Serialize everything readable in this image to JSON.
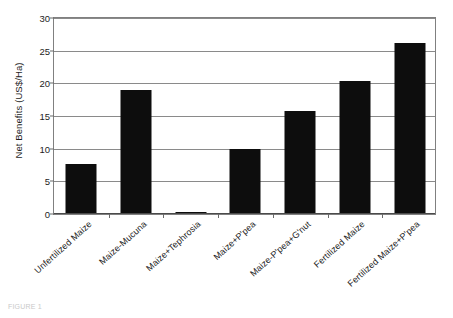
{
  "chart_data": {
    "type": "bar",
    "title": "",
    "xlabel": "",
    "ylabel": "Net Benefits (US$/Ha)",
    "ylim": [
      0,
      30
    ],
    "ytick_labels": [
      "30",
      "25",
      "20",
      "15",
      "10",
      "5",
      "0"
    ],
    "ytick_values": [
      30,
      25,
      20,
      15,
      10,
      5,
      0
    ],
    "grid": true,
    "legend": "none",
    "categories": [
      "Unfertilized Maize",
      "Maize-Mucuna",
      "Maize+Tephrosia",
      "Maize+P'pea",
      "Maize-P'pea+G'nut",
      "Fertilized Maize",
      "Fertilized Maize+P'pea"
    ],
    "values": [
      7.6,
      19.0,
      0.3,
      10.0,
      15.7,
      20.4,
      26.2
    ]
  },
  "caption": {
    "text": "FIGURE 1"
  }
}
